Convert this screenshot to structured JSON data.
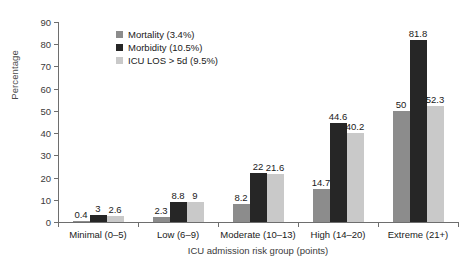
{
  "chart_data": {
    "type": "bar",
    "title": "",
    "xlabel": "ICU admission risk group (points)",
    "ylabel": "Percentage",
    "ylim": [
      0,
      90
    ],
    "yticks": [
      0,
      10,
      20,
      30,
      40,
      50,
      60,
      70,
      80,
      90
    ],
    "grid": false,
    "legend_position": "upper-left-inside",
    "categories": [
      "Minimal (0–5)",
      "Low (6–9)",
      "Moderate (10–13)",
      "High (14–20)",
      "Extreme (21+)"
    ],
    "series": [
      {
        "name": "Mortality (3.4%)",
        "color": "#8c8c8c",
        "values": [
          0.4,
          2.3,
          8.2,
          14.7,
          50
        ],
        "labels": [
          "0.4",
          "2.3",
          "8.2",
          "14.7",
          "50"
        ]
      },
      {
        "name": "Morbidity (10.5%)",
        "color": "#262626",
        "values": [
          3,
          8.8,
          22,
          44.6,
          81.8
        ],
        "labels": [
          "3",
          "8.8",
          "22",
          "44.6",
          "81.8"
        ]
      },
      {
        "name": "ICU LOS > 5d (9.5%)",
        "color": "#c9c9c9",
        "values": [
          2.6,
          9,
          21.6,
          40.2,
          52.3
        ],
        "labels": [
          "2.6",
          "9",
          "21.6",
          "40.2",
          "52.3"
        ]
      }
    ]
  },
  "axis": {
    "y_title": "Percentage",
    "x_title": "ICU admission risk group (points)"
  }
}
